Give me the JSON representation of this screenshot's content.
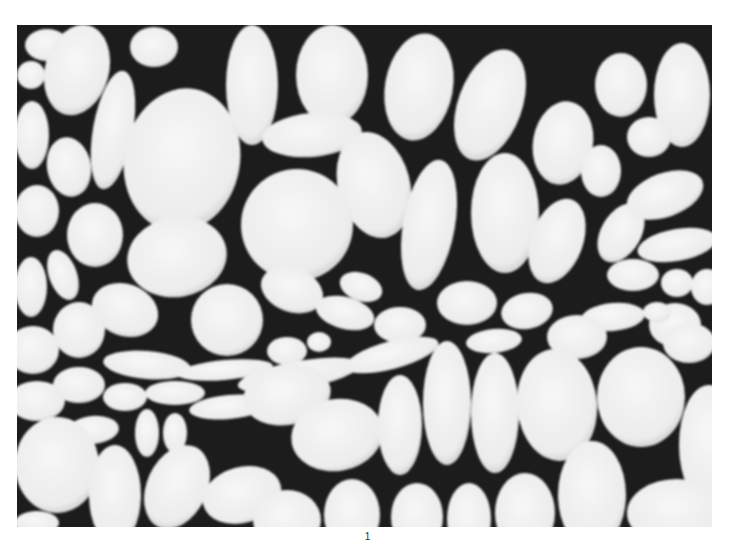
{
  "figure": {
    "colors": {
      "background": "#1c1c1c",
      "cell": "#f2f2f2",
      "cell_shade": "#d9d9d9",
      "page": "#ffffff"
    },
    "cells": [
      {
        "cx": 30,
        "cy": 20,
        "rx": 22,
        "ry": 16,
        "r": 0
      },
      {
        "cx": 60,
        "cy": 45,
        "rx": 32,
        "ry": 46,
        "r": 15
      },
      {
        "cx": 14,
        "cy": 50,
        "rx": 14,
        "ry": 14,
        "r": 0
      },
      {
        "cx": 137,
        "cy": 22,
        "rx": 24,
        "ry": 20,
        "r": 0
      },
      {
        "cx": 96,
        "cy": 105,
        "rx": 20,
        "ry": 60,
        "r": 10
      },
      {
        "cx": 15,
        "cy": 110,
        "rx": 17,
        "ry": 34,
        "r": 0
      },
      {
        "cx": 165,
        "cy": 135,
        "rx": 58,
        "ry": 72,
        "r": 10
      },
      {
        "cx": 235,
        "cy": 60,
        "rx": 26,
        "ry": 60,
        "r": 0
      },
      {
        "cx": 315,
        "cy": 50,
        "rx": 36,
        "ry": 50,
        "r": 0
      },
      {
        "cx": 295,
        "cy": 110,
        "rx": 50,
        "ry": 22,
        "r": -5
      },
      {
        "cx": 402,
        "cy": 62,
        "rx": 34,
        "ry": 54,
        "r": 10
      },
      {
        "cx": 473,
        "cy": 80,
        "rx": 32,
        "ry": 58,
        "r": 20
      },
      {
        "cx": 357,
        "cy": 160,
        "rx": 36,
        "ry": 54,
        "r": -15
      },
      {
        "cx": 52,
        "cy": 142,
        "rx": 22,
        "ry": 30,
        "r": -10
      },
      {
        "cx": 20,
        "cy": 186,
        "rx": 22,
        "ry": 26,
        "r": 0
      },
      {
        "cx": 78,
        "cy": 210,
        "rx": 28,
        "ry": 32,
        "r": 0
      },
      {
        "cx": 160,
        "cy": 232,
        "rx": 50,
        "ry": 40,
        "r": -10
      },
      {
        "cx": 280,
        "cy": 200,
        "rx": 56,
        "ry": 56,
        "r": 0
      },
      {
        "cx": 412,
        "cy": 200,
        "rx": 26,
        "ry": 66,
        "r": 10
      },
      {
        "cx": 488,
        "cy": 188,
        "rx": 34,
        "ry": 60,
        "r": 0
      },
      {
        "cx": 546,
        "cy": 118,
        "rx": 30,
        "ry": 42,
        "r": 10
      },
      {
        "cx": 604,
        "cy": 60,
        "rx": 26,
        "ry": 32,
        "r": 0
      },
      {
        "cx": 665,
        "cy": 70,
        "rx": 28,
        "ry": 52,
        "r": 0
      },
      {
        "cx": 584,
        "cy": 146,
        "rx": 20,
        "ry": 26,
        "r": 0
      },
      {
        "cx": 632,
        "cy": 112,
        "rx": 22,
        "ry": 20,
        "r": 0
      },
      {
        "cx": 540,
        "cy": 216,
        "rx": 26,
        "ry": 44,
        "r": 20
      },
      {
        "cx": 604,
        "cy": 208,
        "rx": 20,
        "ry": 32,
        "r": 30
      },
      {
        "cx": 648,
        "cy": 170,
        "rx": 40,
        "ry": 22,
        "r": -20
      },
      {
        "cx": 660,
        "cy": 220,
        "rx": 40,
        "ry": 16,
        "r": -10
      },
      {
        "cx": 616,
        "cy": 250,
        "rx": 26,
        "ry": 16,
        "r": 0
      },
      {
        "cx": 660,
        "cy": 258,
        "rx": 16,
        "ry": 14,
        "r": 0
      },
      {
        "cx": 690,
        "cy": 262,
        "rx": 16,
        "ry": 18,
        "r": 0
      },
      {
        "cx": 658,
        "cy": 300,
        "rx": 26,
        "ry": 22,
        "r": 0
      },
      {
        "cx": 596,
        "cy": 292,
        "rx": 32,
        "ry": 14,
        "r": -5
      },
      {
        "cx": 640,
        "cy": 287,
        "rx": 14,
        "ry": 10,
        "r": 0
      },
      {
        "cx": 14,
        "cy": 262,
        "rx": 16,
        "ry": 30,
        "r": 0
      },
      {
        "cx": 46,
        "cy": 250,
        "rx": 14,
        "ry": 26,
        "r": -20
      },
      {
        "cx": 108,
        "cy": 285,
        "rx": 34,
        "ry": 26,
        "r": 20
      },
      {
        "cx": 62,
        "cy": 305,
        "rx": 26,
        "ry": 28,
        "r": 0
      },
      {
        "cx": 16,
        "cy": 325,
        "rx": 26,
        "ry": 24,
        "r": 0
      },
      {
        "cx": 210,
        "cy": 295,
        "rx": 36,
        "ry": 36,
        "r": 0
      },
      {
        "cx": 275,
        "cy": 265,
        "rx": 32,
        "ry": 22,
        "r": 20
      },
      {
        "cx": 328,
        "cy": 288,
        "rx": 30,
        "ry": 16,
        "r": 15
      },
      {
        "cx": 344,
        "cy": 262,
        "rx": 22,
        "ry": 14,
        "r": 20
      },
      {
        "cx": 383,
        "cy": 300,
        "rx": 26,
        "ry": 18,
        "r": 0
      },
      {
        "cx": 450,
        "cy": 278,
        "rx": 30,
        "ry": 22,
        "r": 0
      },
      {
        "cx": 510,
        "cy": 286,
        "rx": 26,
        "ry": 18,
        "r": -10
      },
      {
        "cx": 560,
        "cy": 312,
        "rx": 30,
        "ry": 22,
        "r": 0
      },
      {
        "cx": 477,
        "cy": 316,
        "rx": 28,
        "ry": 12,
        "r": -5
      },
      {
        "cx": 270,
        "cy": 326,
        "rx": 20,
        "ry": 14,
        "r": 0
      },
      {
        "cx": 302,
        "cy": 317,
        "rx": 12,
        "ry": 10,
        "r": 0
      },
      {
        "cx": 130,
        "cy": 340,
        "rx": 44,
        "ry": 14,
        "r": 5
      },
      {
        "cx": 208,
        "cy": 345,
        "rx": 48,
        "ry": 10,
        "r": -5
      },
      {
        "cx": 282,
        "cy": 350,
        "rx": 62,
        "ry": 14,
        "r": -10
      },
      {
        "cx": 375,
        "cy": 330,
        "rx": 48,
        "ry": 14,
        "r": -15
      },
      {
        "cx": 62,
        "cy": 360,
        "rx": 26,
        "ry": 18,
        "r": 0
      },
      {
        "cx": 20,
        "cy": 376,
        "rx": 28,
        "ry": 20,
        "r": 0
      },
      {
        "cx": 108,
        "cy": 372,
        "rx": 22,
        "ry": 14,
        "r": 0
      },
      {
        "cx": 158,
        "cy": 368,
        "rx": 30,
        "ry": 12,
        "r": 0
      },
      {
        "cx": 212,
        "cy": 382,
        "rx": 40,
        "ry": 12,
        "r": -5
      },
      {
        "cx": 270,
        "cy": 370,
        "rx": 44,
        "ry": 30,
        "r": -10
      },
      {
        "cx": 76,
        "cy": 405,
        "rx": 26,
        "ry": 14,
        "r": -5
      },
      {
        "cx": 130,
        "cy": 408,
        "rx": 12,
        "ry": 24,
        "r": 0
      },
      {
        "cx": 158,
        "cy": 408,
        "rx": 12,
        "ry": 20,
        "r": 0
      },
      {
        "cx": 320,
        "cy": 410,
        "rx": 46,
        "ry": 36,
        "r": -10
      },
      {
        "cx": 383,
        "cy": 400,
        "rx": 22,
        "ry": 50,
        "r": 0
      },
      {
        "cx": 430,
        "cy": 378,
        "rx": 24,
        "ry": 62,
        "r": 0
      },
      {
        "cx": 478,
        "cy": 388,
        "rx": 24,
        "ry": 60,
        "r": 0
      },
      {
        "cx": 540,
        "cy": 380,
        "rx": 40,
        "ry": 56,
        "r": -5
      },
      {
        "cx": 624,
        "cy": 372,
        "rx": 44,
        "ry": 50,
        "r": 0
      },
      {
        "cx": 672,
        "cy": 318,
        "rx": 26,
        "ry": 20,
        "r": 0
      },
      {
        "cx": 692,
        "cy": 420,
        "rx": 30,
        "ry": 60,
        "r": 0
      },
      {
        "cx": 40,
        "cy": 440,
        "rx": 42,
        "ry": 48,
        "r": 0
      },
      {
        "cx": 98,
        "cy": 470,
        "rx": 26,
        "ry": 50,
        "r": 0
      },
      {
        "cx": 160,
        "cy": 462,
        "rx": 30,
        "ry": 44,
        "r": 25
      },
      {
        "cx": 225,
        "cy": 470,
        "rx": 40,
        "ry": 28,
        "r": -15
      },
      {
        "cx": 270,
        "cy": 495,
        "rx": 34,
        "ry": 30,
        "r": 0
      },
      {
        "cx": 335,
        "cy": 490,
        "rx": 28,
        "ry": 36,
        "r": 0
      },
      {
        "cx": 400,
        "cy": 492,
        "rx": 26,
        "ry": 34,
        "r": 0
      },
      {
        "cx": 452,
        "cy": 494,
        "rx": 22,
        "ry": 36,
        "r": 0
      },
      {
        "cx": 508,
        "cy": 488,
        "rx": 30,
        "ry": 40,
        "r": 0
      },
      {
        "cx": 575,
        "cy": 470,
        "rx": 34,
        "ry": 54,
        "r": 0
      },
      {
        "cx": 660,
        "cy": 488,
        "rx": 50,
        "ry": 34,
        "r": 0
      },
      {
        "cx": 20,
        "cy": 498,
        "rx": 22,
        "ry": 12,
        "r": 0
      }
    ]
  },
  "page": {
    "number": "1"
  }
}
